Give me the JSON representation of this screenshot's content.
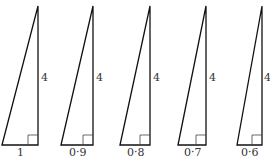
{
  "triangles": [
    {
      "base_label": "1",
      "height_label": "4",
      "x_left": 2,
      "x_right": 38,
      "y_top": 6,
      "y_base": 145
    },
    {
      "base_label": "0·9",
      "height_label": "4",
      "x_left": 61,
      "x_right": 93,
      "y_top": 6,
      "y_base": 145
    },
    {
      "base_label": "0·8",
      "height_label": "4",
      "x_left": 120,
      "x_right": 150,
      "y_top": 6,
      "y_base": 145
    },
    {
      "base_label": "0·7",
      "height_label": "4",
      "x_left": 178,
      "x_right": 206,
      "y_top": 6,
      "y_base": 145
    },
    {
      "base_label": "0·6",
      "height_label": "4",
      "x_left": 237,
      "x_right": 262,
      "y_top": 6,
      "y_base": 145
    }
  ],
  "colors": {
    "stroke": "#111111",
    "right_angle": "#444444",
    "text": "#333333"
  }
}
